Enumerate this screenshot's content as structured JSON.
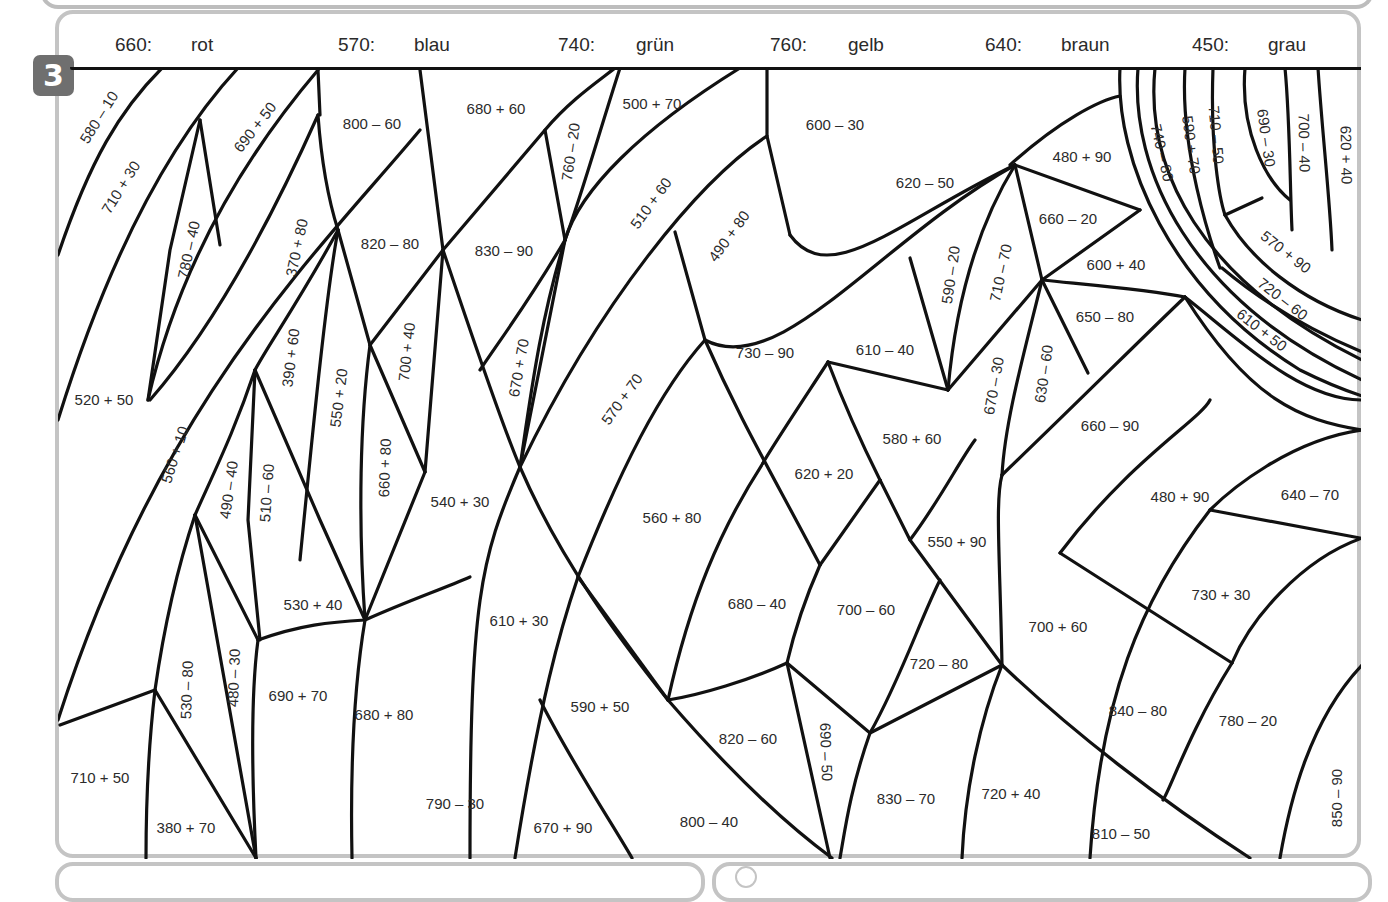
{
  "task": {
    "number": "3"
  },
  "legend": [
    {
      "value": "660:",
      "color_name": "rot",
      "hex": "#e53935"
    },
    {
      "value": "570:",
      "color_name": "blau",
      "hex": "#1e63c4"
    },
    {
      "value": "740:",
      "color_name": "grün",
      "hex": "#2e9d44"
    },
    {
      "value": "760:",
      "color_name": "gelb",
      "hex": "#f5d21a"
    },
    {
      "value": "640:",
      "color_name": "braun",
      "hex": "#8a5a2b"
    },
    {
      "value": "450:",
      "color_name": "grau",
      "hex": "#8f8f8f"
    }
  ],
  "cells": [
    {
      "expr": "580 – 10",
      "x": 100,
      "y": 118,
      "rotate": -58
    },
    {
      "expr": "710 + 30",
      "x": 122,
      "y": 188,
      "rotate": -58
    },
    {
      "expr": "690 + 50",
      "x": 256,
      "y": 128,
      "rotate": -52
    },
    {
      "expr": "780 – 40",
      "x": 190,
      "y": 250,
      "rotate": -78
    },
    {
      "expr": "800 – 60",
      "x": 372,
      "y": 125,
      "rotate": 0
    },
    {
      "expr": "370 + 80",
      "x": 298,
      "y": 248,
      "rotate": -78
    },
    {
      "expr": "820 – 80",
      "x": 390,
      "y": 245,
      "rotate": 0
    },
    {
      "expr": "520 + 50",
      "x": 104,
      "y": 401,
      "rotate": 0
    },
    {
      "expr": "390 + 60",
      "x": 292,
      "y": 358,
      "rotate": -83
    },
    {
      "expr": "550 + 20",
      "x": 340,
      "y": 398,
      "rotate": -83
    },
    {
      "expr": "700 + 40",
      "x": 408,
      "y": 352,
      "rotate": -84
    },
    {
      "expr": "560 + 10",
      "x": 176,
      "y": 455,
      "rotate": -72
    },
    {
      "expr": "490 – 40",
      "x": 230,
      "y": 490,
      "rotate": -82
    },
    {
      "expr": "510 – 60",
      "x": 268,
      "y": 493,
      "rotate": -86
    },
    {
      "expr": "660 + 80",
      "x": 386,
      "y": 468,
      "rotate": -88
    },
    {
      "expr": "540 + 30",
      "x": 460,
      "y": 503,
      "rotate": 0
    },
    {
      "expr": "530 + 40",
      "x": 313,
      "y": 606,
      "rotate": 0
    },
    {
      "expr": "680 + 60",
      "x": 496,
      "y": 110,
      "rotate": 0
    },
    {
      "expr": "500 + 70",
      "x": 652,
      "y": 105,
      "rotate": 0
    },
    {
      "expr": "760 – 20",
      "x": 572,
      "y": 152,
      "rotate": -82
    },
    {
      "expr": "830 – 90",
      "x": 504,
      "y": 252,
      "rotate": 0
    },
    {
      "expr": "510 + 60",
      "x": 652,
      "y": 204,
      "rotate": -54
    },
    {
      "expr": "490 + 80",
      "x": 730,
      "y": 237,
      "rotate": -54
    },
    {
      "expr": "670 + 70",
      "x": 520,
      "y": 368,
      "rotate": -80
    },
    {
      "expr": "570 + 70",
      "x": 623,
      "y": 400,
      "rotate": -54
    },
    {
      "expr": "600 – 30",
      "x": 835,
      "y": 126,
      "rotate": 0
    },
    {
      "expr": "620 – 50",
      "x": 925,
      "y": 184,
      "rotate": 0
    },
    {
      "expr": "480 + 90",
      "x": 1082,
      "y": 158,
      "rotate": 0
    },
    {
      "expr": "660 – 20",
      "x": 1068,
      "y": 220,
      "rotate": 0
    },
    {
      "expr": "600 + 40",
      "x": 1116,
      "y": 266,
      "rotate": 0
    },
    {
      "expr": "650 – 80",
      "x": 1105,
      "y": 318,
      "rotate": 0
    },
    {
      "expr": "590 – 20",
      "x": 952,
      "y": 275,
      "rotate": -82
    },
    {
      "expr": "710 – 70",
      "x": 1002,
      "y": 273,
      "rotate": -78
    },
    {
      "expr": "670 – 30",
      "x": 995,
      "y": 386,
      "rotate": -80
    },
    {
      "expr": "630 – 60",
      "x": 1045,
      "y": 374,
      "rotate": -82
    },
    {
      "expr": "730 – 90",
      "x": 765,
      "y": 354,
      "rotate": 0
    },
    {
      "expr": "610 – 40",
      "x": 885,
      "y": 351,
      "rotate": 0
    },
    {
      "expr": "580 + 60",
      "x": 912,
      "y": 440,
      "rotate": 0
    },
    {
      "expr": "620 + 20",
      "x": 824,
      "y": 475,
      "rotate": 0
    },
    {
      "expr": "560 + 80",
      "x": 672,
      "y": 519,
      "rotate": 0
    },
    {
      "expr": "660 – 90",
      "x": 1110,
      "y": 427,
      "rotate": 0
    },
    {
      "expr": "480 + 90",
      "x": 1180,
      "y": 498,
      "rotate": 0
    },
    {
      "expr": "640 – 70",
      "x": 1310,
      "y": 496,
      "rotate": 0
    },
    {
      "expr": "550 + 90",
      "x": 957,
      "y": 543,
      "rotate": 0
    },
    {
      "expr": "730 + 30",
      "x": 1221,
      "y": 596,
      "rotate": 0
    },
    {
      "expr": "610 + 30",
      "x": 519,
      "y": 622,
      "rotate": 0
    },
    {
      "expr": "680 – 40",
      "x": 757,
      "y": 605,
      "rotate": 0
    },
    {
      "expr": "700 – 60",
      "x": 866,
      "y": 611,
      "rotate": 0
    },
    {
      "expr": "700 + 60",
      "x": 1058,
      "y": 628,
      "rotate": 0
    },
    {
      "expr": "720 – 80",
      "x": 939,
      "y": 665,
      "rotate": 0
    },
    {
      "expr": "690 + 70",
      "x": 298,
      "y": 697,
      "rotate": 0
    },
    {
      "expr": "680 + 80",
      "x": 384,
      "y": 716,
      "rotate": 0
    },
    {
      "expr": "590 + 50",
      "x": 600,
      "y": 708,
      "rotate": 0
    },
    {
      "expr": "820 – 60",
      "x": 748,
      "y": 740,
      "rotate": 0
    },
    {
      "expr": "690 – 50",
      "x": 825,
      "y": 752,
      "rotate": 88
    },
    {
      "expr": "840 – 80",
      "x": 1138,
      "y": 712,
      "rotate": 0
    },
    {
      "expr": "780 – 20",
      "x": 1248,
      "y": 722,
      "rotate": 0
    },
    {
      "expr": "530 – 80",
      "x": 188,
      "y": 690,
      "rotate": -88
    },
    {
      "expr": "480 – 30",
      "x": 235,
      "y": 678,
      "rotate": -88
    },
    {
      "expr": "710 + 50",
      "x": 100,
      "y": 779,
      "rotate": 0
    },
    {
      "expr": "380 + 70",
      "x": 186,
      "y": 829,
      "rotate": 0
    },
    {
      "expr": "790 – 30",
      "x": 455,
      "y": 805,
      "rotate": 0
    },
    {
      "expr": "670 + 90",
      "x": 563,
      "y": 829,
      "rotate": 0
    },
    {
      "expr": "800 – 40",
      "x": 709,
      "y": 823,
      "rotate": 0
    },
    {
      "expr": "830 – 70",
      "x": 906,
      "y": 800,
      "rotate": 0
    },
    {
      "expr": "720 + 40",
      "x": 1011,
      "y": 795,
      "rotate": 0
    },
    {
      "expr": "810 – 50",
      "x": 1121,
      "y": 835,
      "rotate": 0
    },
    {
      "expr": "850 – 90",
      "x": 1338,
      "y": 798,
      "rotate": -90
    },
    {
      "expr": "740 – 80",
      "x": 1161,
      "y": 153,
      "rotate": 77
    },
    {
      "expr": "590 + 70",
      "x": 1190,
      "y": 145,
      "rotate": 82
    },
    {
      "expr": "710 – 50",
      "x": 1215,
      "y": 135,
      "rotate": 85
    },
    {
      "expr": "690 – 30",
      "x": 1265,
      "y": 138,
      "rotate": 82
    },
    {
      "expr": "700 – 40",
      "x": 1303,
      "y": 143,
      "rotate": 89
    },
    {
      "expr": "620 + 40",
      "x": 1345,
      "y": 155,
      "rotate": 89
    },
    {
      "expr": "570 + 90",
      "x": 1285,
      "y": 253,
      "rotate": 38
    },
    {
      "expr": "720 – 60",
      "x": 1282,
      "y": 300,
      "rotate": 38
    },
    {
      "expr": "610 + 50",
      "x": 1261,
      "y": 331,
      "rotate": 38
    }
  ]
}
